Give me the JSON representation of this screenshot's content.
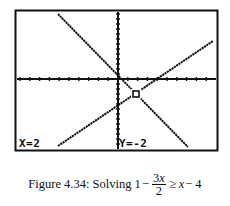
{
  "figure": {
    "screen": {
      "frame": {
        "x1": 15,
        "y1": 10,
        "x2": 217,
        "y2": 150
      },
      "axes": {
        "x_axis_y": 79,
        "y_axis_x": 118,
        "x_tick_spacing": 9.8,
        "y_tick_spacing": 5
      },
      "cursor_label_x": "X=2",
      "cursor_label_y": "Y=-2",
      "intersection_point": {
        "x": 136,
        "y": 94
      }
    },
    "caption": {
      "prefix": "Figure 4.34: Solving 1",
      "minus": "−",
      "frac_num_coef": "3",
      "frac_num_var": "x",
      "frac_den": "2",
      "rel": "≥",
      "rhs_var": "x",
      "rhs_rest": "− 4"
    }
  },
  "chart_data": {
    "type": "line",
    "xlabel": "",
    "ylabel": "",
    "grid": false,
    "series": [
      {
        "name": "y1 = 1 - 3x/2",
        "pixels": [
          [
            58,
            14
          ],
          [
            188,
            147
          ]
        ],
        "slope": -1.5,
        "intercept": 1
      },
      {
        "name": "y2 = x - 4",
        "pixels": [
          [
            58,
            146
          ],
          [
            213,
            41
          ]
        ],
        "slope": 1,
        "intercept": -4
      }
    ],
    "intersection": {
      "x": 2,
      "y": -2
    },
    "annotations": [
      "X=2",
      "Y=-2"
    ]
  }
}
